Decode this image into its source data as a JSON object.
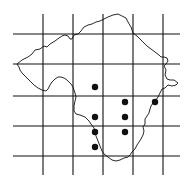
{
  "map": {
    "width": 188,
    "height": 186,
    "background": "#ffffff",
    "line_color": "#111111",
    "grid": {
      "vertical_x": [
        43,
        73,
        103,
        133,
        163
      ],
      "vertical_y_range": [
        14,
        175
      ],
      "horizontal_y": [
        34,
        64,
        96,
        126,
        156
      ],
      "horizontal_x_range": [
        13,
        180
      ]
    },
    "region_outline": "M17,64 L22,60 L28,57 L32,54 L35,50 L40,49 L44,46 L47,47 L50,44 L55,41 L59,38 L62,36 L65,35 L68,36 L70,39 L72,39 L74,35 L78,34 L81,31 L84,27 L88,25 L92,24 L96,22 L100,21 L104,19 L108,17 L113,15 L118,14 L122,16 L126,18 L128,22 L131,27 L133,33 L137,36 L140,39 L143,42 L147,46 L151,49 L155,52 L159,55 L161,57 L164,57 L167,58 L168,61 L166,64 L164,66 L166,70 L165,75 L167,79 L170,80 L174,80 L178,83 L176,85 L172,86 L168,85 L165,88 L162,89 L160,93 L158,97 L156,100 L153,103 L151,106 L150,109 L149,113 L147,116 L145,119 L145,124 L143,127 L144,131 L143,135 L141,139 L139,142 L137,145 L135,149 L132,152 L130,155 L128,157 L124,158 L120,160 L116,161 L112,160 L108,157 L104,154 L102,151 L100,146 L98,141 L96,136 L95,132 L94,128 L91,124 L89,121 L85,117 L80,115 L76,114 L74,111 L74,106 L75,101 L76,97 L75,93 L74,90 L73,87 L71,84 L69,82 L67,80 L64,78 L61,77 L58,77 L55,79 L52,82 L50,85 L48,89 L46,91 L42,90 L38,88 L34,85 L31,82 L28,79 L25,76 L22,73 L20,70 L19,67 Z",
    "dot_radius": 3.2,
    "dots": [
      {
        "x": 95,
        "y": 87
      },
      {
        "x": 125,
        "y": 102
      },
      {
        "x": 155,
        "y": 102
      },
      {
        "x": 95,
        "y": 117
      },
      {
        "x": 125,
        "y": 117
      },
      {
        "x": 95,
        "y": 132
      },
      {
        "x": 125,
        "y": 132
      },
      {
        "x": 95,
        "y": 147
      }
    ]
  }
}
